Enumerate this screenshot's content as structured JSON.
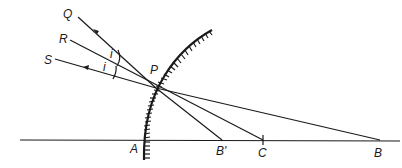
{
  "diagram": {
    "type": "optics-ray-diagram",
    "labels": {
      "Q": "Q",
      "R": "R",
      "S": "S",
      "P": "P",
      "A": "A",
      "B_prime": "B'",
      "C": "C",
      "B": "B",
      "angle_i_1": "i",
      "angle_i_2": "i"
    },
    "colors": {
      "ink": "#1a1a1a",
      "background": "#ffffff"
    }
  }
}
